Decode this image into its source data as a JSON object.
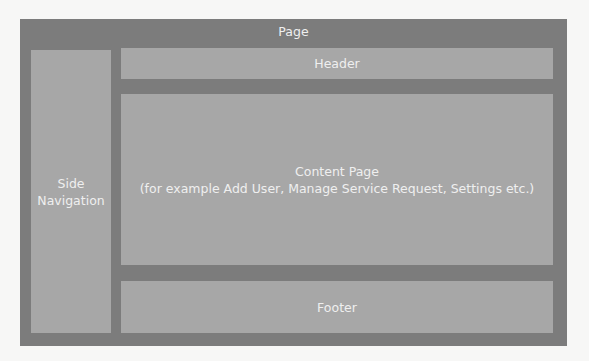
{
  "diagram": {
    "page": {
      "label": "Page"
    },
    "side_navigation": {
      "line1": "Side",
      "line2": "Navigation"
    },
    "header": {
      "label": "Header"
    },
    "content": {
      "title": "Content Page",
      "subtitle": "(for example Add User, Manage Service Request, Settings etc.)"
    },
    "footer": {
      "label": "Footer"
    },
    "colors": {
      "page": "#7c7c7c",
      "region": "#a7a7a7",
      "text": "#efefef",
      "background": "#f7f7f6"
    }
  }
}
